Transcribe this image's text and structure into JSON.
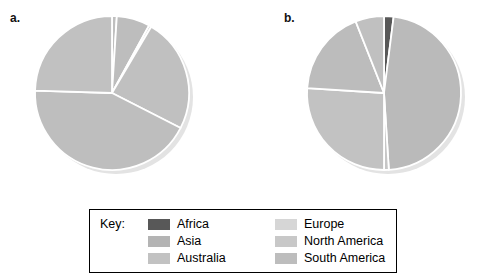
{
  "figure": {
    "panels": [
      {
        "label": "a."
      },
      {
        "label": "b."
      }
    ]
  },
  "legend": {
    "key_label": "Key:",
    "columns": [
      {
        "items": [
          {
            "label": "Africa",
            "color": "#585858"
          },
          {
            "label": "Asia",
            "color": "#b4b4b4"
          },
          {
            "label": "Australia",
            "color": "#c2c2c2"
          }
        ]
      },
      {
        "items": [
          {
            "label": "Europe",
            "color": "#d6d6d6"
          },
          {
            "label": "North America",
            "color": "#c8c8c8"
          },
          {
            "label": "South America",
            "color": "#bdbdbd"
          }
        ]
      }
    ]
  },
  "chart_data": [
    {
      "type": "pie",
      "title": "a.",
      "labels": [
        "Africa",
        "Asia",
        "Australia",
        "Europe",
        "North America",
        "South America"
      ],
      "values": [
        1,
        7,
        0.5,
        24,
        43,
        24.5
      ],
      "colors": [
        "#bfbfbf",
        "#bdbdbd",
        "#c4c4c4",
        "#c0c0c0",
        "#bebebe",
        "#c1c1c1"
      ],
      "start_angle": 0,
      "direction": "clockwise",
      "slice_border": "#ffffff",
      "legend": "shared-key-below"
    },
    {
      "type": "pie",
      "title": "b.",
      "labels": [
        "Africa",
        "Asia",
        "Australia",
        "Europe",
        "North America",
        "South America"
      ],
      "values": [
        2,
        47,
        1,
        26,
        18,
        6
      ],
      "colors": [
        "#585858",
        "#bababa",
        "#c6c6c6",
        "#c2c2c2",
        "#bcbcbc",
        "#c0c0c0"
      ],
      "start_angle": 0,
      "direction": "clockwise",
      "slice_border": "#ffffff",
      "legend": "shared-key-below"
    }
  ]
}
